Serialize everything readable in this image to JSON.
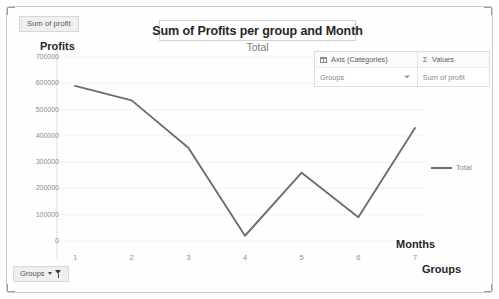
{
  "field_chip": {
    "label": "Sum of profit"
  },
  "header": {
    "title": "Sum of Profits per group and Month",
    "subtitle": "Total"
  },
  "fields_pane": {
    "axis": {
      "icon": "grid-icon",
      "header_label": "Axis (Categories)",
      "value": "Groups",
      "caret_icon": "chevron-down-icon"
    },
    "values": {
      "icon": "sigma-icon",
      "header_label": "Values",
      "value": "Sum of profit"
    }
  },
  "legend": {
    "entries": [
      {
        "label": "Total",
        "color": "#6e6e6e"
      }
    ]
  },
  "slicer": {
    "label": "Groups",
    "caret_icon": "chevron-down-icon",
    "filter_icon": "funnel-icon"
  },
  "chart_data": {
    "type": "line",
    "title": "Sum of Profits per group and Month",
    "subtitle": "Total",
    "xlabel": "Months",
    "xlabel2": "Groups",
    "ylabel": "Profits",
    "categories": [
      "1",
      "2",
      "3",
      "4",
      "5",
      "6",
      "7"
    ],
    "series": [
      {
        "name": "Total",
        "color": "#6e6e6e",
        "values": [
          590000,
          535000,
          355000,
          20000,
          260000,
          90000,
          430000
        ]
      }
    ],
    "ylim": [
      0,
      700000
    ],
    "ytick_values": [
      700000,
      600000,
      500000,
      400000,
      300000,
      200000,
      100000,
      0
    ],
    "ytick_labels": [
      "700000",
      "600000",
      "500000",
      "400000",
      "300000",
      "200000",
      "100000",
      "0"
    ],
    "grid": "horizontal-faint",
    "legend_position": "right"
  }
}
